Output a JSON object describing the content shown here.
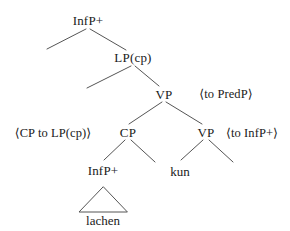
{
  "diagram": {
    "type": "syntax-tree",
    "title": "",
    "nodes": {
      "root": "InfP+",
      "lp_cp": "LP(cp)",
      "vp_upper": "VP",
      "cp": "CP",
      "vp_lower": "VP",
      "infp_embedded": "InfP+",
      "kun": "kun",
      "lachen": "lachen"
    },
    "annotations": {
      "to_predp": "⟨to PredP⟩",
      "cp_to_lp_cp": "⟨CP to LP(cp)⟩",
      "to_infp_plus": "⟨to InfP+⟩"
    },
    "colors": {
      "line": "#555555",
      "text": "#1a1a1a",
      "background": "#ffffff"
    }
  }
}
